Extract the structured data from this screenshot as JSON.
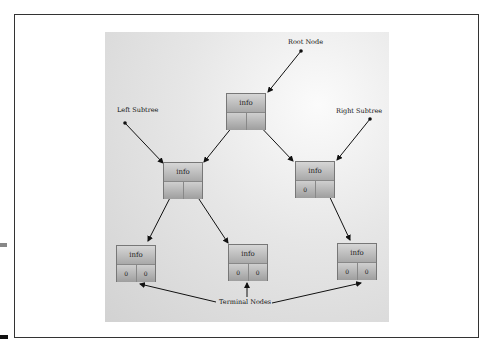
{
  "labels": {
    "root": "Root Node",
    "left_subtree": "Left Subtree",
    "right_subtree": "Right Subtree",
    "terminal": "Terminal Nodes"
  },
  "nodes": [
    {
      "id": "root",
      "info": "info",
      "left": "",
      "right": ""
    },
    {
      "id": "left",
      "info": "info",
      "left": "",
      "right": ""
    },
    {
      "id": "right",
      "info": "info",
      "left": "0",
      "right": ""
    },
    {
      "id": "leaf1",
      "info": "info",
      "left": "0",
      "right": "0"
    },
    {
      "id": "leaf2",
      "info": "info",
      "left": "0",
      "right": "0"
    },
    {
      "id": "leaf3",
      "info": "info",
      "left": "0",
      "right": "0"
    }
  ]
}
